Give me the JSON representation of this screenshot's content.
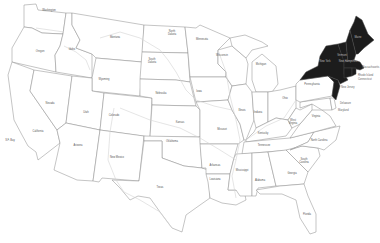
{
  "map": {
    "title": "United States",
    "highlight_color": "#1c1c1c",
    "base_color": "#ffffff",
    "border_color": "#8a8a8a",
    "highlighted_region": "Northeast",
    "highlighted_states": [
      "Maine",
      "New Hampshire",
      "Vermont",
      "New York",
      "Massachusetts",
      "Rhode Island",
      "Connecticut",
      "New Jersey"
    ]
  },
  "labels": {
    "washington": "Washington",
    "oregon": "Oregon",
    "california": "California",
    "idaho": "Idaho",
    "nevada": "Nevada",
    "montana": "Montana",
    "wyoming": "Wyoming",
    "utah": "Utah",
    "arizona": "Arizona",
    "colorado": "Colorado",
    "new_mexico": "New Mexico",
    "north_dakota": "North Dakota",
    "south_dakota": "South Dakota",
    "nebraska": "Nebraska",
    "kansas": "Kansas",
    "oklahoma": "Oklahoma",
    "texas": "Texas",
    "minnesota": "Minnesota",
    "iowa": "Iowa",
    "missouri": "Missouri",
    "arkansas": "Arkansas",
    "louisiana": "Louisiana",
    "wisconsin": "Wisconsin",
    "illinois": "Illinois",
    "michigan": "Michigan",
    "indiana": "Indiana",
    "ohio": "Ohio",
    "kentucky": "Kentucky",
    "tennessee": "Tennessee",
    "mississippi": "Mississippi",
    "alabama": "Alabama",
    "georgia": "Georgia",
    "florida": "Florida",
    "south_carolina": "South Carolina",
    "north_carolina": "North Carolina",
    "virginia": "Virginia",
    "west_virginia": "West Virginia",
    "pennsylvania": "Pennsylvania",
    "new_york": "New York",
    "vermont": "Vermont",
    "new_hampshire": "New Hampshire",
    "maine": "Maine",
    "massachusetts": "Massachusetts",
    "rhode_island": "Rhode Island",
    "connecticut": "Connecticut",
    "new_jersey": "New Jersey",
    "delaware": "Delaware",
    "maryland": "Maryland",
    "sf_bay": "S.F. Bay"
  }
}
